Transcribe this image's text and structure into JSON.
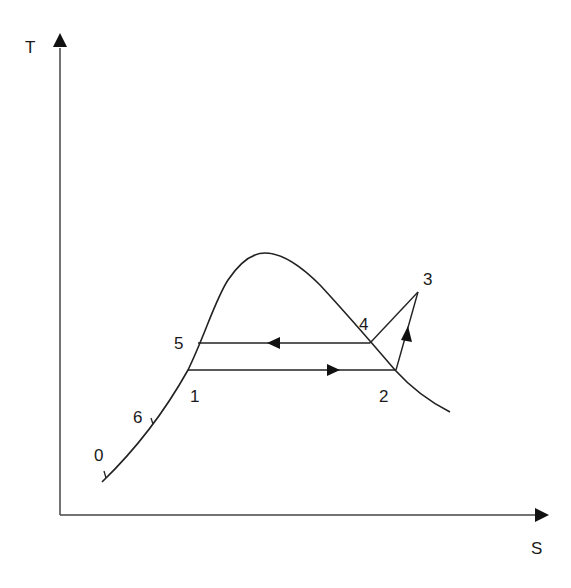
{
  "axes": {
    "y_label": "T",
    "x_label": "S"
  },
  "points": [
    {
      "id": "0",
      "label": "0"
    },
    {
      "id": "1",
      "label": "1"
    },
    {
      "id": "2",
      "label": "2"
    },
    {
      "id": "3",
      "label": "3"
    },
    {
      "id": "4",
      "label": "4"
    },
    {
      "id": "5",
      "label": "5"
    },
    {
      "id": "6",
      "label": "6"
    }
  ],
  "colors": {
    "line": "#222222",
    "background": "#ffffff"
  }
}
